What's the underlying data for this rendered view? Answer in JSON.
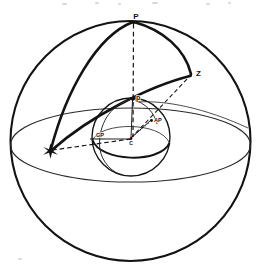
{
  "figure": {
    "kind": "celestial-sphere-navigational-triangle",
    "background_color": "#ffffff",
    "ink_color": "#131313",
    "thin_ink_color": "#2a2a2a"
  },
  "labels": {
    "celestial_pole": "P",
    "zenith": "Z",
    "terrestrial_pole": "p",
    "assumed_position": "AP",
    "geographical_position": "GP",
    "center": "C",
    "star_glyph": "✶"
  },
  "icons": {
    "star": "star-icon"
  },
  "geometry": {
    "outer_sphere": {
      "cx": 130.5,
      "cy": 141,
      "r": 120
    },
    "inner_sphere": {
      "cx": 131,
      "cy": 137,
      "r": 39
    },
    "horizon_ellipse": {
      "cx": 130.5,
      "cy": 145,
      "rx": 120,
      "ry": 37
    },
    "points": {
      "P": {
        "x": 135,
        "y": 21
      },
      "Z": {
        "x": 192,
        "y": 75
      },
      "star": {
        "x": 50,
        "y": 151
      },
      "p": {
        "x": 133,
        "y": 99
      },
      "AP": {
        "x": 152,
        "y": 120
      },
      "GP": {
        "x": 104,
        "y": 139
      },
      "C": {
        "x": 131,
        "y": 139
      }
    }
  },
  "elements": {
    "outer_sphere_name": "celestial-sphere-outline",
    "horizon_name": "celestial-horizon-ellipse",
    "equator_name": "celestial-equator-arc",
    "inner_sphere_name": "earth-sphere-outline",
    "earth_equator_name": "earth-equator-arc",
    "earth_meridian_name": "earth-meridian-arc",
    "triangle_side_PZ": "arc-pole-to-zenith",
    "triangle_side_P_star": "arc-pole-to-star",
    "triangle_side_Z_star": "arc-zenith-to-star",
    "radius_C_Z": "dashed-radius-center-to-zenith",
    "radius_C_star": "dashed-radius-center-to-star",
    "axis_p_P": "dashed-polar-axis",
    "radius_C_p": "radius-center-to-terrestrial-pole",
    "radius_C_AP": "radius-center-to-assumed-position",
    "radius_C_GP": "radius-center-to-geographical-position"
  }
}
